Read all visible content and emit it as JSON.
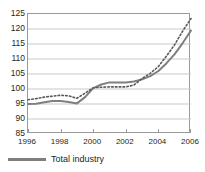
{
  "chart_data": {
    "type": "line",
    "title": "",
    "xlabel": "",
    "ylabel": "",
    "xlim": [
      1996,
      2006
    ],
    "ylim": [
      85,
      125
    ],
    "ytick_step": 5,
    "yticks": [
      125,
      120,
      115,
      110,
      105,
      100,
      95,
      90,
      85
    ],
    "xticks": [
      1996,
      1998,
      2000,
      2002,
      2004,
      2006
    ],
    "grid": true,
    "legend_position": "bottom-left",
    "x": [
      1996,
      1996.5,
      1997,
      1997.5,
      1998,
      1998.5,
      1999,
      1999.5,
      2000,
      2000.5,
      2001,
      2001.5,
      2002,
      2002.5,
      2003,
      2003.5,
      2004,
      2004.5,
      2005,
      2005.5,
      2006
    ],
    "series": [
      {
        "name": "Total industry",
        "style": "solid",
        "color": "#7f7f7f",
        "values": [
          95.0,
          95.1,
          95.6,
          96.0,
          96.0,
          95.7,
          95.2,
          97.3,
          100.3,
          101.5,
          102.2,
          102.2,
          102.2,
          102.5,
          103.2,
          104.3,
          106.0,
          108.6,
          111.6,
          115.4,
          119.5
        ]
      },
      {
        "name": "",
        "style": "dotted",
        "color": "#595959",
        "values": [
          96.4,
          96.8,
          97.3,
          97.6,
          97.9,
          97.7,
          96.9,
          98.6,
          100.4,
          100.6,
          100.7,
          100.7,
          100.7,
          101.3,
          103.5,
          105.2,
          107.5,
          111.0,
          114.8,
          119.4,
          123.5
        ]
      }
    ]
  },
  "legend": {
    "items": [
      {
        "label": "Total industry",
        "color": "#7f7f7f"
      }
    ]
  }
}
